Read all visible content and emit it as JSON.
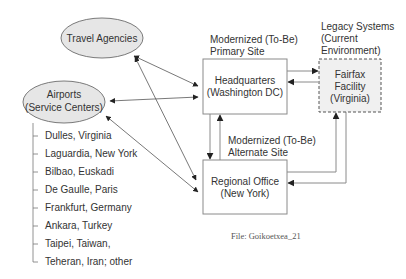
{
  "nodes": {
    "travel_agencies": {
      "label": "Travel Agencies"
    },
    "airports": {
      "label_line1": "Airports",
      "label_line2": "(Service Centers)"
    },
    "headquarters": {
      "label_line1": "Headquarters",
      "label_line2": "(Washington DC)"
    },
    "regional_office": {
      "label_line1": "Regional Office",
      "label_line2": "(New York)"
    },
    "fairfax": {
      "label_line1": "Fairfax",
      "label_line2": "Facility",
      "label_line3": "(Virginia)"
    }
  },
  "annotations": {
    "primary_site": {
      "line1": "Modernized (To-Be)",
      "line2": "Primary Site"
    },
    "alternate_site": {
      "line1": "Modernized (To-Be)",
      "line2": "Alternate Site"
    },
    "legacy": {
      "line1": "Legacy Systems",
      "line2": "(Current",
      "line3": "Environment)"
    }
  },
  "airport_list": [
    "Dulles, Virginia",
    "Laguardia, New York",
    "Bilbao, Euskadi",
    "De Gaulle, Paris",
    "Frankfurt, Germany",
    "Ankara, Turkey",
    "Taipei, Taiwan,",
    "Teheran, Iran; other"
  ],
  "edges": [
    {
      "from": "Travel Agencies",
      "to": "Headquarters",
      "direction": "bidirectional"
    },
    {
      "from": "Airports",
      "to": "Headquarters",
      "direction": "bidirectional"
    },
    {
      "from": "Travel Agencies",
      "to": "Regional Office",
      "direction": "bidirectional"
    },
    {
      "from": "Airports",
      "to": "Regional Office",
      "direction": "bidirectional"
    },
    {
      "from": "Headquarters",
      "to": "Fairfax Facility",
      "direction": "forward"
    },
    {
      "from": "Fairfax Facility",
      "to": "Headquarters",
      "direction": "forward"
    },
    {
      "from": "Headquarters",
      "to": "Regional Office",
      "direction": "forward"
    },
    {
      "from": "Regional Office",
      "to": "Headquarters",
      "direction": "forward"
    },
    {
      "from": "Regional Office",
      "to": "Fairfax Facility",
      "direction": "forward"
    },
    {
      "from": "Fairfax Facility",
      "to": "Regional Office",
      "direction": "forward"
    }
  ],
  "caption": "File: Goikoetxea_21"
}
